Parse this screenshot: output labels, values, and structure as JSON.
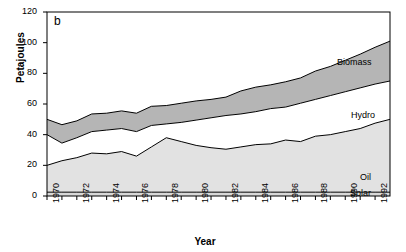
{
  "panel_tag": "b",
  "axes": {
    "ylabel": "Petajoules",
    "xlabel": "Year",
    "yticks": [
      0,
      20,
      40,
      60,
      80,
      100,
      120
    ],
    "xticks_labeled": [
      1970,
      1972,
      1974,
      1976,
      1978,
      1980,
      1982,
      1984,
      1986,
      1988,
      1990,
      1992
    ]
  },
  "series_labels": {
    "biomass": "Biomass",
    "hydro": "Hydro",
    "oil": "Oil",
    "solar": "Solar"
  },
  "colors": {
    "biomass_fill": "#b5b5b5",
    "hydro_fill": "#ffffff",
    "oil_fill": "#e2e2e2",
    "solar_fill": "#d8d8d8",
    "line": "#000000",
    "axis": "#000000",
    "background": "#ffffff"
  },
  "chart_data": {
    "type": "area",
    "title": "",
    "xlabel": "Year",
    "ylabel": "Petajoules",
    "xlim": [
      1970,
      1993
    ],
    "ylim": [
      0,
      120
    ],
    "grid": false,
    "stacked": true,
    "legend_position": "inline-right",
    "x": [
      1970,
      1971,
      1972,
      1973,
      1974,
      1975,
      1976,
      1977,
      1978,
      1979,
      1980,
      1981,
      1982,
      1983,
      1984,
      1985,
      1986,
      1987,
      1988,
      1989,
      1990,
      1991,
      1992,
      1993
    ],
    "series": [
      {
        "name": "Solar",
        "values": [
          2.5,
          2.5,
          2.5,
          2.5,
          2.5,
          2.5,
          2.5,
          2.5,
          2.5,
          2.5,
          2.5,
          2.5,
          2.5,
          2.5,
          2.5,
          2.5,
          2.5,
          2.5,
          2.5,
          2.5,
          2.5,
          2.5,
          2.5,
          2.5
        ]
      },
      {
        "name": "Oil",
        "values": [
          17.5,
          20.5,
          22.5,
          25.5,
          25.0,
          26.5,
          23.5,
          29.5,
          35.5,
          33.0,
          30.5,
          29.0,
          28.0,
          29.5,
          31.0,
          31.5,
          34.0,
          33.0,
          36.5,
          37.5,
          39.5,
          41.5,
          45.0,
          47.5
        ]
      },
      {
        "name": "Hydro",
        "values": [
          20.0,
          11.5,
          13.0,
          14.0,
          15.5,
          15.0,
          16.0,
          14.0,
          9.0,
          12.5,
          16.5,
          19.5,
          22.0,
          21.5,
          21.5,
          23.0,
          21.5,
          25.0,
          24.0,
          25.5,
          26.0,
          26.5,
          25.5,
          25.0
        ]
      },
      {
        "name": "Biomass",
        "values": [
          10.0,
          12.0,
          11.0,
          11.5,
          11.0,
          11.5,
          12.0,
          12.5,
          12.0,
          12.5,
          12.5,
          12.0,
          12.0,
          15.0,
          16.0,
          15.5,
          16.5,
          16.5,
          18.5,
          19.0,
          20.5,
          22.0,
          24.0,
          26.0
        ]
      }
    ],
    "cumulative_tops": {
      "solar": [
        2.5,
        2.5,
        2.5,
        2.5,
        2.5,
        2.5,
        2.5,
        2.5,
        2.5,
        2.5,
        2.5,
        2.5,
        2.5,
        2.5,
        2.5,
        2.5,
        2.5,
        2.5,
        2.5,
        2.5,
        2.5,
        2.5,
        2.5,
        2.5
      ],
      "oil": [
        20,
        23,
        25,
        28,
        27.5,
        29,
        26,
        32,
        38,
        35.5,
        33,
        31.5,
        30.5,
        32,
        33.5,
        34,
        36.5,
        35.5,
        39,
        40,
        42,
        44,
        47.5,
        50
      ],
      "hydro": [
        40,
        34.5,
        38,
        42,
        43,
        44,
        42,
        46,
        47,
        48,
        49.5,
        51,
        52.5,
        53.5,
        55,
        57,
        58,
        60.5,
        63,
        65.5,
        68,
        70.5,
        73,
        75
      ],
      "biomass": [
        50,
        46.5,
        49,
        53.5,
        54,
        55.5,
        54,
        58.5,
        59,
        60.5,
        62,
        63,
        64.5,
        68.5,
        71,
        72.5,
        74.5,
        77,
        81.5,
        84.5,
        88.5,
        92.5,
        97,
        101
      ]
    }
  }
}
